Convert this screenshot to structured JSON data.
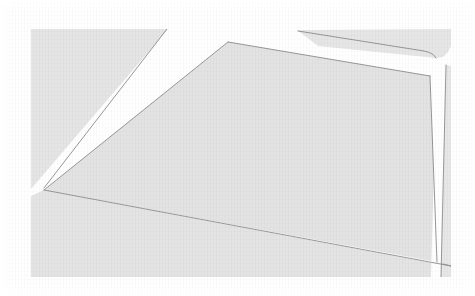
{
  "figure": {
    "kind": "scanned-cadastral-parcel-map",
    "title": "",
    "width": 475,
    "height": 296,
    "background_color": "#ffffff",
    "paper_color": "#fdfdfd"
  },
  "colors": {
    "block_fill": "#e4e4e4",
    "block_fill_light": "#e9e9e9",
    "parcel_fill": "#e2e2e2",
    "road_white": "#ffffff",
    "boundary_line": "#8c8c8c",
    "block_edge_line": "#a8a8a8",
    "grain": "#000000"
  },
  "map_extent": {
    "left": 31,
    "top": 29,
    "right": 451,
    "bottom": 277
  },
  "features": {
    "blocks": [
      {
        "name": "northwest-block",
        "role": "land block northwest of the diagonal road",
        "fill": "#e5e5e5",
        "points": "31,29 167,29 44,188 31,188"
      },
      {
        "name": "central-parcel-block",
        "role": "large central quadrilateral parcel",
        "fill": "#e3e3e3",
        "points": "228,42 430,76 451,262 44,190"
      },
      {
        "name": "northeast-block",
        "role": "land block north of the central parcel with rounded south-east corner",
        "fill": "#e6e6e6",
        "points": "296,29 451,29 451,50 441,58 316,45"
      },
      {
        "name": "southwest-block",
        "role": "land block south-west of the central parcel boundary line",
        "fill": "#e4e4e4",
        "points": "31,196 44,190 451,268 451,277 31,277"
      },
      {
        "name": "east-strip-block",
        "role": "narrow land strip east of the vertical road",
        "fill": "#e7e7e7",
        "points": "446,70 451,71 451,277 441,277"
      }
    ],
    "roads": [
      {
        "name": "northwest-diagonal-road",
        "role": "white diagonal road running from top edge down to the south-west",
        "color": "#ffffff",
        "points": "167,29 228,29 44,190 31,190 31,188"
      },
      {
        "name": "north-road",
        "role": "white road separating the northeast block from the central parcel",
        "color": "#ffffff",
        "points": "228,42 296,29 451,29 451,24 228,24"
      },
      {
        "name": "east-vertical-road",
        "role": "narrow near-vertical white road along the right side",
        "color": "#ffffff",
        "points": "437,62 446,63 441,277 431,277"
      }
    ],
    "boundary_lines": [
      {
        "name": "parcel-north-edge",
        "role": "north boundary of the central parcel",
        "from": [
          228,
          42
        ],
        "to": [
          430,
          76
        ]
      },
      {
        "name": "parcel-west-edge",
        "role": "west boundary of the central parcel",
        "from": [
          228,
          42
        ],
        "to": [
          44,
          190
        ]
      },
      {
        "name": "parcel-south-edge",
        "role": "south boundary of the central parcel",
        "from": [
          44,
          190
        ],
        "to": [
          451,
          266
        ]
      },
      {
        "name": "parcel-east-edge",
        "role": "east boundary of the central parcel along the vertical road",
        "from": [
          430,
          76
        ],
        "to": [
          437,
          262
        ]
      },
      {
        "name": "northeast-block-south-edge",
        "role": "southern edge of the northeast block",
        "from": [
          296,
          31
        ],
        "to": [
          434,
          55
        ]
      },
      {
        "name": "east-strip-west-edge",
        "role": "west edge of the narrow eastern strip",
        "from": [
          446,
          65
        ],
        "to": [
          441,
          277
        ]
      },
      {
        "name": "southeast-cross-edge",
        "role": "short boundary east of the vertical road",
        "from": [
          443,
          262
        ],
        "to": [
          451,
          263
        ]
      },
      {
        "name": "northwest-block-east-edge",
        "role": "east edge of the northwest block along the diagonal road",
        "from": [
          167,
          29
        ],
        "to": [
          44,
          188
        ]
      }
    ],
    "vertices": [
      {
        "name": "parcel-north-apex",
        "x": 228,
        "y": 42
      },
      {
        "name": "parcel-west-corner",
        "x": 44,
        "y": 190
      },
      {
        "name": "parcel-northeast-corner",
        "x": 430,
        "y": 76
      },
      {
        "name": "parcel-southeast-corner",
        "x": 437,
        "y": 262
      },
      {
        "name": "northeast-block-rounded-corner",
        "x": 437,
        "y": 56
      }
    ]
  },
  "annotations": {
    "labels": [],
    "text": []
  }
}
